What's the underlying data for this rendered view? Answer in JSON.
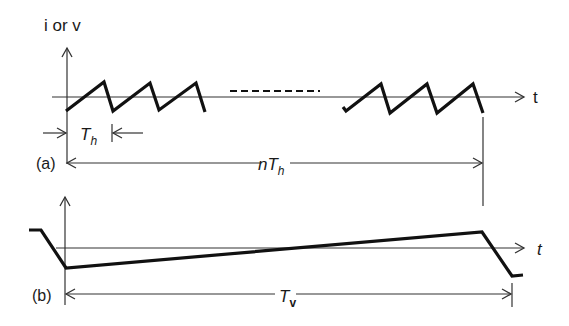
{
  "diagram": {
    "panel_a": {
      "label": "(a)",
      "y_axis_label": "i or v",
      "x_axis_label": "t",
      "period_short_label": {
        "main": "T",
        "sub": "h"
      },
      "period_long_label": {
        "prefix": "n",
        "main": "T",
        "sub": "h"
      },
      "waveform": "sawtooth",
      "description": "Repeated horizontal sawtooth with ellipsis (dashes) indicating n periods"
    },
    "panel_b": {
      "label": "(b)",
      "x_axis_label": "t",
      "period_label": {
        "main": "T",
        "sub": "v"
      },
      "waveform": "slow ramp",
      "description": "Single slow ramp with fast retrace over vertical period"
    },
    "colors": {
      "background": "#ffffff",
      "waveform": "#111111",
      "axes": "#333333"
    }
  }
}
